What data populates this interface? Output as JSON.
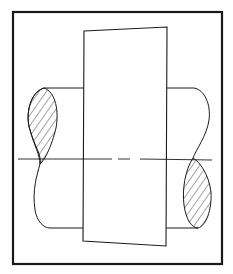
{
  "diagram": {
    "colors": {
      "line": "#1a1a1a",
      "background": "#ffffff"
    },
    "elements": [
      "frame",
      "hub-rectangle",
      "shaft-left",
      "shaft-right",
      "center-line",
      "hatched-section-left",
      "hatched-section-right"
    ]
  }
}
